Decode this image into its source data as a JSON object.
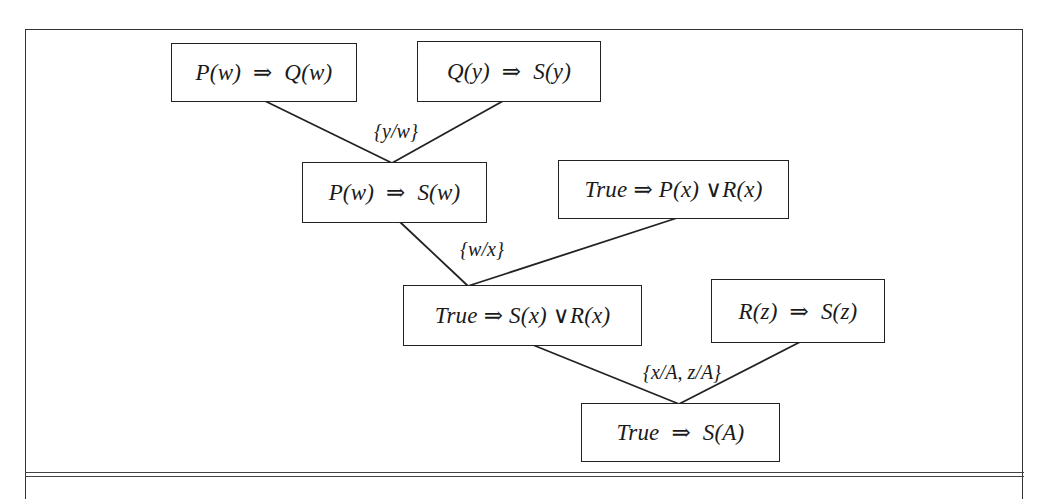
{
  "diagram": {
    "type": "resolution-proof-tree",
    "nodes": [
      {
        "id": "n1",
        "text": "P(w)  ⇒  Q(w)"
      },
      {
        "id": "n2",
        "text": "Q(y)  ⇒  S(y)"
      },
      {
        "id": "n3",
        "text": "P(w)  ⇒  S(w)"
      },
      {
        "id": "n4",
        "text": "True ⇒ P(x) ∨R(x)"
      },
      {
        "id": "n5",
        "text": "True ⇒ S(x) ∨R(x)"
      },
      {
        "id": "n6",
        "text": "R(z)  ⇒  S(z)"
      },
      {
        "id": "n7",
        "text": "True  ⇒  S(A)"
      }
    ],
    "edges": [
      {
        "from": "n1",
        "to": "n3"
      },
      {
        "from": "n2",
        "to": "n3"
      },
      {
        "from": "n3",
        "to": "n5"
      },
      {
        "from": "n4",
        "to": "n5"
      },
      {
        "from": "n5",
        "to": "n7"
      },
      {
        "from": "n6",
        "to": "n7"
      }
    ],
    "substitutions": [
      {
        "step": "n1+n2→n3",
        "text": "{y/w}"
      },
      {
        "step": "n3+n4→n5",
        "text": "{w/x}"
      },
      {
        "step": "n5+n6→n7",
        "text": "{x/A, z/A}"
      }
    ],
    "colors": {
      "line": "#222222",
      "background": "#ffffff"
    }
  }
}
